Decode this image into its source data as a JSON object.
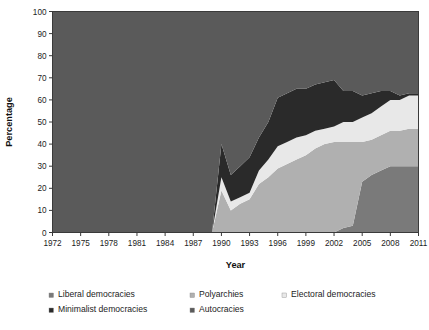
{
  "chart": {
    "type": "area",
    "title": "",
    "xlabel": "Year",
    "ylabel": "Percentage"
  },
  "axes": {
    "y_ticks": [
      "0",
      "10",
      "20",
      "30",
      "40",
      "50",
      "60",
      "70",
      "80",
      "90",
      "100"
    ],
    "x_ticks": [
      "1972",
      "1975",
      "1978",
      "1981",
      "1984",
      "1987",
      "1990",
      "1993",
      "1996",
      "1999",
      "2002",
      "2005",
      "2008",
      "2011"
    ],
    "ylim": [
      0,
      100
    ],
    "xlim": [
      1972,
      2011
    ]
  },
  "legend": {
    "position": "bottom",
    "entries": [
      {
        "label": "Liberal democracies",
        "color": "#7a7a7a",
        "swatch": "square-marker"
      },
      {
        "label": "Polyarchies",
        "color": "#b0b0b0",
        "swatch": "square-marker"
      },
      {
        "label": "Electoral democracies",
        "color": "#e8e8e8",
        "swatch": "square-marker"
      },
      {
        "label": "Minimalist democracies",
        "color": "#2a2a2a",
        "swatch": "square-marker"
      },
      {
        "label": "Autocracies",
        "color": "#5a5a5a",
        "swatch": "square-marker"
      }
    ]
  },
  "chart_data": {
    "type": "area",
    "stacked": true,
    "title": "",
    "xlabel": "Year",
    "ylabel": "Percentage",
    "xlim": [
      1972,
      2011
    ],
    "ylim": [
      0,
      100
    ],
    "grid": false,
    "legend_position": "bottom",
    "x": [
      1972,
      1973,
      1974,
      1975,
      1976,
      1977,
      1978,
      1979,
      1980,
      1981,
      1982,
      1983,
      1984,
      1985,
      1986,
      1987,
      1988,
      1989,
      1990,
      1991,
      1992,
      1993,
      1994,
      1995,
      1996,
      1997,
      1998,
      1999,
      2000,
      2001,
      2002,
      2003,
      2004,
      2005,
      2006,
      2007,
      2008,
      2009,
      2010,
      2011
    ],
    "stack_order_bottom_to_top": [
      "Liberal democracies",
      "Polyarchies",
      "Electoral democracies",
      "Minimalist democracies",
      "Autocracies"
    ],
    "series": [
      {
        "name": "Liberal democracies",
        "color": "#7a7a7a",
        "values": [
          0,
          0,
          0,
          0,
          0,
          0,
          0,
          0,
          0,
          0,
          0,
          0,
          0,
          0,
          0,
          0,
          0,
          0,
          0,
          0,
          0,
          0,
          0,
          0,
          0,
          0,
          0,
          0,
          0,
          0,
          0,
          2,
          3,
          23,
          26,
          28,
          30,
          30,
          30,
          30
        ]
      },
      {
        "name": "Polyarchies",
        "color": "#b0b0b0",
        "values": [
          0,
          0,
          0,
          0,
          0,
          0,
          0,
          0,
          0,
          0,
          0,
          0,
          0,
          0,
          0,
          0,
          0,
          0,
          19,
          10,
          13,
          15,
          22,
          25,
          29,
          31,
          33,
          35,
          38,
          40,
          41,
          39,
          38,
          18,
          16,
          16,
          16,
          16,
          17,
          17
        ]
      },
      {
        "name": "Electoral democracies",
        "color": "#e8e8e8",
        "values": [
          0,
          0,
          0,
          0,
          0,
          0,
          0,
          0,
          0,
          0,
          0,
          0,
          0,
          0,
          0,
          0,
          0,
          0,
          6,
          4,
          3,
          3,
          6,
          8,
          10,
          10,
          10,
          9,
          8,
          7,
          7,
          9,
          9,
          11,
          12,
          13,
          14,
          14,
          15,
          15
        ]
      },
      {
        "name": "Minimalist democracies",
        "color": "#2a2a2a",
        "values": [
          0,
          0,
          0,
          0,
          0,
          0,
          0,
          0,
          0,
          0,
          0,
          0,
          0,
          0,
          0,
          0,
          0,
          0,
          15,
          12,
          14,
          16,
          15,
          17,
          22,
          22,
          22,
          21,
          21,
          21,
          21,
          14,
          14,
          10,
          9,
          7,
          4,
          2,
          1,
          1
        ]
      },
      {
        "name": "Autocracies",
        "color": "#5a5a5a",
        "values": [
          100,
          100,
          100,
          100,
          100,
          100,
          100,
          100,
          100,
          100,
          100,
          100,
          100,
          100,
          100,
          100,
          100,
          100,
          60,
          74,
          70,
          66,
          57,
          50,
          39,
          37,
          35,
          35,
          33,
          32,
          31,
          36,
          36,
          38,
          37,
          36,
          36,
          38,
          37,
          37
        ]
      }
    ]
  }
}
